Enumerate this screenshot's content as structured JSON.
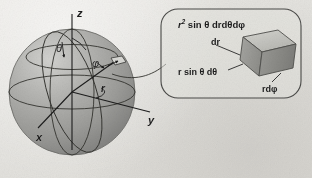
{
  "figure": {
    "type": "spherical-coordinates-volume-element-diagram",
    "background_color": "#e7e6e2",
    "ink_color": "#1c1c1c",
    "sphere": {
      "fill_color": "#a8a8a6",
      "highlight_color": "#c9c9c6",
      "shadow_color": "#8d8d8b",
      "center_x": 72,
      "center_y": 92,
      "radius": 63
    },
    "axes": [
      {
        "name": "z-axis",
        "label": "z",
        "label_x": 77,
        "label_y": 8
      },
      {
        "name": "x-axis",
        "label": "x",
        "label_x": 36,
        "label_y": 132
      },
      {
        "name": "y-axis",
        "label": "y",
        "label_x": 148,
        "label_y": 115
      }
    ],
    "angles": [
      {
        "name": "theta",
        "label": "θ",
        "label_x": 56,
        "label_y": 43
      },
      {
        "name": "phi",
        "label": "φ",
        "label_x": 92,
        "label_y": 58
      }
    ],
    "radius_label": {
      "name": "r",
      "label": "r",
      "label_x": 101,
      "label_y": 84
    },
    "callout": {
      "border_color": "#4a4a48",
      "fill_color": "#e3e2de",
      "x": 160,
      "y": 8,
      "width": 142,
      "height": 92,
      "corner_radius": 16,
      "volume_formula": {
        "prefix": "r",
        "exponent": "2",
        "rest": " sin θ drdθdφ",
        "full_text": "r² sin θ drdθdφ",
        "x": 178,
        "y": 19
      },
      "edge_labels": [
        {
          "name": "dr",
          "text": "dr",
          "x": 211,
          "y": 38
        },
        {
          "name": "r-sin-theta-dtheta",
          "text": "r sin θ dθ",
          "x": 178,
          "y": 68
        },
        {
          "name": "r-dphi",
          "text": "rdφ",
          "x": 262,
          "y": 85
        }
      ],
      "volume_element": {
        "name": "volume-element-box",
        "top_face_color": "#c2c2bd",
        "front_face_color": "#9d9d99",
        "side_face_color": "#868682",
        "edge_color": "#4f4f4c"
      }
    },
    "leader_line": {
      "name": "callout-leader-line",
      "from_x": 104,
      "from_y": 72,
      "to_x": 164,
      "to_y": 66
    }
  }
}
